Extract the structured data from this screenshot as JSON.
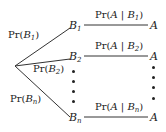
{
  "diagram": {
    "type": "probability-tree",
    "root": {
      "label": ""
    },
    "branches": [
      {
        "node": "B",
        "sub": "1",
        "edge_label_pre": "Pr(",
        "edge_label_var": "B",
        "edge_label_sub": "1",
        "edge_label_post": ")",
        "cond_pre": "Pr(",
        "cond_a": "A",
        "cond_bar": " | ",
        "cond_b": "B",
        "cond_sub": "1",
        "cond_post": ")",
        "leaf": "A"
      },
      {
        "node": "B",
        "sub": "2",
        "edge_label_pre": "Pr(",
        "edge_label_var": "B",
        "edge_label_sub": "2",
        "edge_label_post": ")",
        "cond_pre": "Pr(",
        "cond_a": "A",
        "cond_bar": " | ",
        "cond_b": "B",
        "cond_sub": "2",
        "cond_post": ")",
        "leaf": "A"
      },
      {
        "node": "B",
        "sub": "n",
        "edge_label_pre": "Pr(",
        "edge_label_var": "B",
        "edge_label_sub": "n",
        "edge_label_post": ")",
        "cond_pre": "Pr(",
        "cond_a": "A",
        "cond_bar": " | ",
        "cond_b": "B",
        "cond_sub": "n",
        "cond_post": ")",
        "leaf": "A"
      }
    ],
    "ellipsis": "vertical-dots"
  }
}
